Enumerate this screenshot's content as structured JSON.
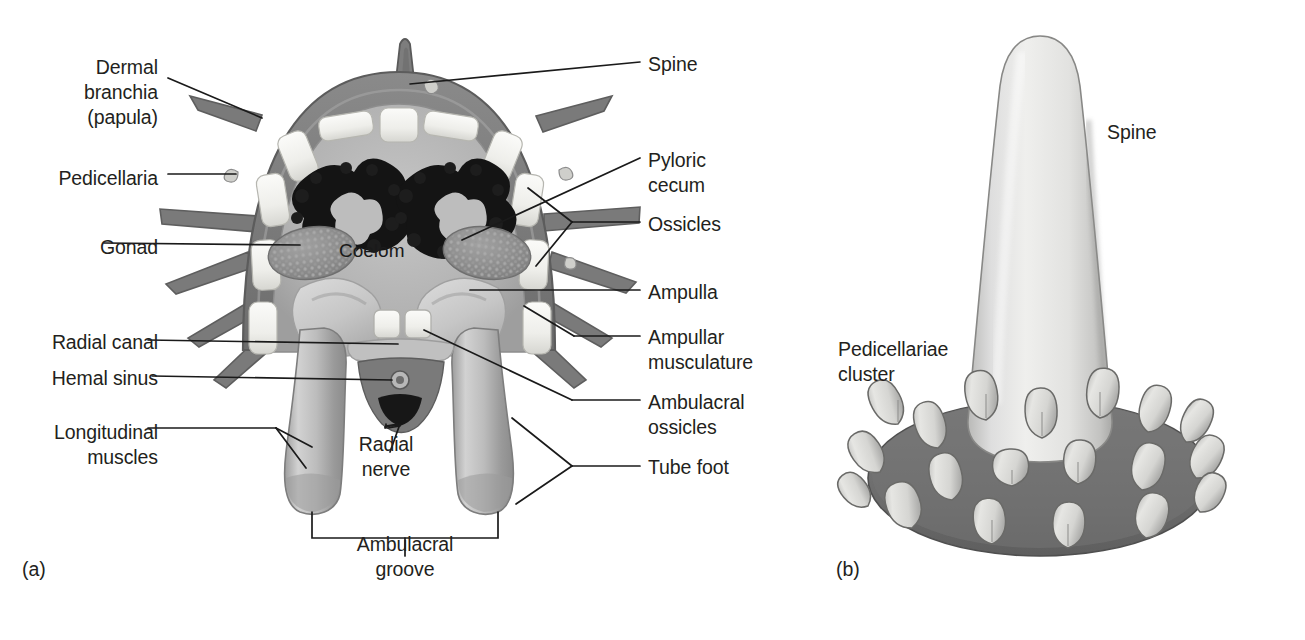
{
  "figure": {
    "panels": [
      {
        "id": "a",
        "label": "(a)",
        "caption_x": 22,
        "caption_y": 558
      },
      {
        "id": "b",
        "label": "(b)",
        "caption_x": 836,
        "caption_y": 558
      }
    ]
  },
  "panel_a": {
    "title": "Sea star arm cross section",
    "internal_label": "Coelom",
    "labels": [
      {
        "name": "dermal-branchia",
        "text": "Dermal\nbranchia\n(papula)",
        "align": "right",
        "x": 8,
        "y": 55,
        "width": 150
      },
      {
        "name": "pedicellaria",
        "text": "Pedicellaria",
        "align": "right",
        "x": 8,
        "y": 166,
        "width": 150
      },
      {
        "name": "gonad",
        "text": "Gonad",
        "align": "right",
        "x": 8,
        "y": 235,
        "width": 150
      },
      {
        "name": "radial-canal",
        "text": "Radial canal",
        "align": "right",
        "x": 8,
        "y": 330,
        "width": 150
      },
      {
        "name": "hemal-sinus",
        "text": "Hemal sinus",
        "align": "right",
        "x": 8,
        "y": 366,
        "width": 150
      },
      {
        "name": "longitudinal-muscles",
        "text": "Longitudinal\nmuscles",
        "align": "right",
        "x": 8,
        "y": 420,
        "width": 150
      },
      {
        "name": "spine",
        "text": "Spine",
        "align": "left",
        "x": 648,
        "y": 52,
        "width": 200
      },
      {
        "name": "pyloric-cecum",
        "text": "Pyloric\ncecum",
        "align": "left",
        "x": 648,
        "y": 148,
        "width": 200
      },
      {
        "name": "ossicles",
        "text": "Ossicles",
        "align": "left",
        "x": 648,
        "y": 212,
        "width": 200
      },
      {
        "name": "ampulla",
        "text": "Ampulla",
        "align": "left",
        "x": 648,
        "y": 280,
        "width": 200
      },
      {
        "name": "ampullar-musculature",
        "text": "Ampullar\nmusculature",
        "align": "left",
        "x": 648,
        "y": 325,
        "width": 200
      },
      {
        "name": "ambulacral-ossicles",
        "text": "Ambulacral\nossicles",
        "align": "left",
        "x": 648,
        "y": 390,
        "width": 200
      },
      {
        "name": "tube-foot",
        "text": "Tube foot",
        "align": "left",
        "x": 648,
        "y": 455,
        "width": 200
      },
      {
        "name": "radial-nerve",
        "text": "Radial\nnerve",
        "align": "center",
        "x": 331,
        "y": 432,
        "width": 110
      },
      {
        "name": "ambulacral-groove",
        "text": "Ambulacral\ngroove",
        "align": "center",
        "x": 330,
        "y": 532,
        "width": 190
      }
    ]
  },
  "panel_b": {
    "title": "Spine with pedicellariae",
    "labels": [
      {
        "name": "spine-b",
        "text": "Spine",
        "align": "left",
        "x": 1107,
        "y": 120,
        "width": 120
      },
      {
        "name": "pedicellariae-cluster",
        "text": "Pedicellariae\ncluster",
        "align": "left",
        "x": 838,
        "y": 337,
        "width": 160
      }
    ]
  },
  "colors": {
    "ink": "#231f20",
    "body_wall": "#7b7b7b",
    "body_wall_dark": "#6a6a6a",
    "coelom": "#b5b5b5",
    "ossicle": "#f2f2ef",
    "ossicle_shadow": "#d8d8d4",
    "pyloric_cecum": "#141414",
    "gonad": "#8e8e8e",
    "tube_foot": "#b9b9b9",
    "ampulla": "#cfcfcf",
    "spine_light": "#e8e8e6",
    "disc_dark": "#6e6e6e",
    "radial_nerve": "#1c1c1c",
    "background": "#ffffff"
  }
}
